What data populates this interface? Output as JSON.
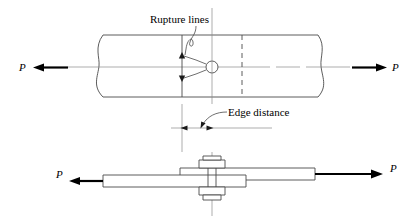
{
  "figure": {
    "kind": "engineering-diagram",
    "colors": {
      "outline": "#4a4a4a",
      "centerline": "#8a8a8a",
      "arrow": "#000000",
      "text": "#000000",
      "background": "#ffffff"
    },
    "labels": {
      "rupture_lines": "Rupture lines",
      "edge_distance": "Edge distance",
      "force_top_left": "P",
      "force_top_right": "P",
      "force_bottom_left": "P",
      "force_bottom_right": "P"
    },
    "views": {
      "plan": {
        "name": "plan-view",
        "plate_top_y": 35,
        "plate_bottom_y": 97,
        "plate_left_break_x": 100,
        "plate_right_break_x": 320,
        "bolt_hole_center_x": 212,
        "bolt_hole_center_y": 67,
        "bolt_hole_radius": 6,
        "rupture_line_x": 182,
        "dashed_line_x": 242,
        "centerline_y": 67
      },
      "elevation": {
        "name": "elevation-view",
        "upper_plate_y_top": 168,
        "upper_plate_y_bottom": 180,
        "lower_plate_y_top": 175,
        "lower_plate_y_bottom": 187,
        "bolt_axis_x": 212,
        "nut_top_y": 158,
        "nut_bottom_y": 198
      },
      "dimension": {
        "name": "edge-distance-dimension",
        "line_y": 128,
        "arrow_left_x": 180,
        "arrow_right_x": 216,
        "extension_left_x": 182,
        "extension_right_x": 212
      }
    }
  }
}
